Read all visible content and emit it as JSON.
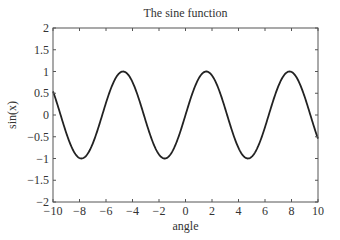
{
  "chart_data": {
    "type": "line",
    "title": "The sine function",
    "xlabel": "angle",
    "ylabel": "sin(x)",
    "xlim": [
      -10,
      10
    ],
    "ylim": [
      -2,
      2
    ],
    "xticks": [
      -10,
      -8,
      -6,
      -4,
      -2,
      0,
      2,
      4,
      6,
      8,
      10
    ],
    "yticks": [
      -2,
      -1.5,
      -1,
      -0.5,
      0,
      0.5,
      1,
      1.5,
      2
    ],
    "xtick_labels": [
      "−10",
      "−8",
      "−6",
      "−4",
      "−2",
      "0",
      "2",
      "4",
      "6",
      "8",
      "10"
    ],
    "ytick_labels": [
      "−2",
      "−1.5",
      "−1",
      "−0.5",
      "0",
      "0.5",
      "1",
      "1.5",
      "2"
    ],
    "grid": false,
    "legend": null,
    "series": [
      {
        "name": "sin(x)",
        "function": "sin(x)",
        "color": "#222222",
        "x": [
          -10,
          -9,
          -8,
          -7,
          -6,
          -5,
          -4,
          -3,
          -2,
          -1,
          0,
          1,
          2,
          3,
          4,
          5,
          6,
          7,
          8,
          9,
          10
        ],
        "values": [
          0.54,
          -0.41,
          -0.99,
          -0.66,
          0.28,
          0.96,
          0.76,
          -0.14,
          -0.91,
          -0.84,
          0,
          0.84,
          0.91,
          0.14,
          -0.76,
          -0.96,
          -0.28,
          0.66,
          0.99,
          0.41,
          -0.54
        ]
      }
    ]
  },
  "colors": {
    "line": "#222222",
    "axes": "#555555",
    "text": "#333333",
    "background": "#ffffff"
  }
}
